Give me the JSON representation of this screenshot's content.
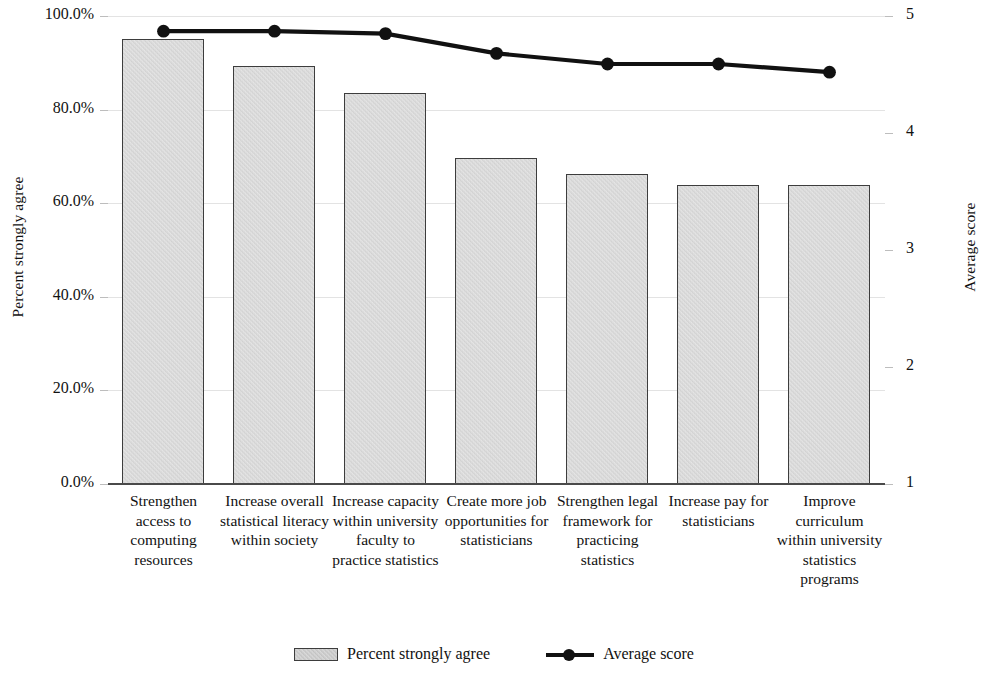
{
  "chart_data": {
    "type": "bar",
    "title": "",
    "subtitle": "",
    "xlabel": "",
    "ylabel": "Percent strongly agree",
    "y2label": "Average score",
    "grid": true,
    "legend_position": "bottom",
    "ylim": [
      0,
      1
    ],
    "y2lim": [
      1,
      5
    ],
    "ytick_labels": [
      "100.0%",
      "80.0%",
      "60.0%",
      "40.0%",
      "20.0%",
      "0.0%"
    ],
    "ytick_values": [
      1.0,
      0.8,
      0.6,
      0.4,
      0.2,
      0.0
    ],
    "y2tick_labels": [
      "5",
      "4",
      "3",
      "2",
      "1"
    ],
    "y2tick_values": [
      5,
      4,
      3,
      2,
      1
    ],
    "categories": [
      "Strengthen access to computing resources",
      "Increase overall statistical literacy within society",
      "Increase capacity within university faculty to practice statistics",
      "Create more job opportunities for statisticians",
      "Strengthen legal framework for practicing statistics",
      "Increase pay for statisticians",
      "Improve curriculum within university statistics programs"
    ],
    "series": [
      {
        "name": "Percent strongly agree",
        "kind": "bar",
        "axis": "left",
        "color": "#d9d9d9",
        "edge_color": "#3d3d3d",
        "values": [
          0.952,
          0.893,
          0.835,
          0.697,
          0.662,
          0.639,
          0.639
        ],
        "value_labels": [
          "95.2%",
          "89.3%",
          "83.5%",
          "69.7%",
          "66.2%",
          "63.9%",
          "63.9%"
        ]
      },
      {
        "name": "Average score",
        "kind": "line",
        "axis": "right",
        "color": "#111111",
        "values": [
          4.87,
          4.87,
          4.85,
          4.68,
          4.59,
          4.59,
          4.52
        ]
      }
    ]
  },
  "legend": {
    "entries": [
      {
        "label": "Percent strongly agree",
        "marker": "bar-swatch"
      },
      {
        "label": "Average score",
        "marker": "line-marker-swatch"
      }
    ]
  }
}
